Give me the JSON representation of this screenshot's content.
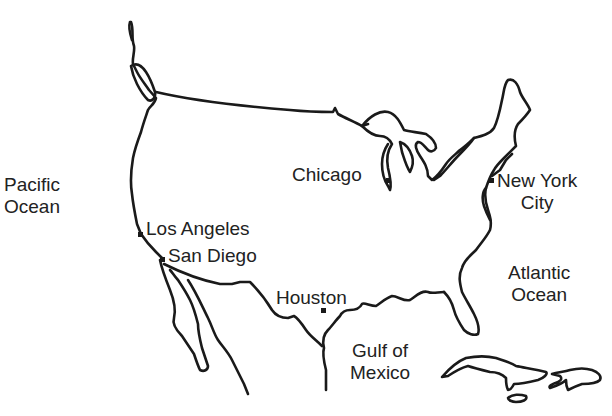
{
  "map": {
    "type": "outline map",
    "region": "United States and Mexico",
    "stroke_color": "#1a1a1a",
    "background_color": "#ffffff"
  },
  "water_bodies": [
    {
      "id": "pacific",
      "line1": "Pacific",
      "line2": "Ocean"
    },
    {
      "id": "atlantic",
      "line1": "Atlantic",
      "line2": "Ocean"
    },
    {
      "id": "gulf",
      "line1": "Gulf of",
      "line2": "Mexico"
    }
  ],
  "cities": [
    {
      "id": "chicago",
      "name": "Chicago"
    },
    {
      "id": "new-york",
      "line1": "New York",
      "line2": "City"
    },
    {
      "id": "los-angeles",
      "name": "Los Angeles"
    },
    {
      "id": "san-diego",
      "name": "San Diego"
    },
    {
      "id": "houston",
      "name": "Houston"
    }
  ]
}
